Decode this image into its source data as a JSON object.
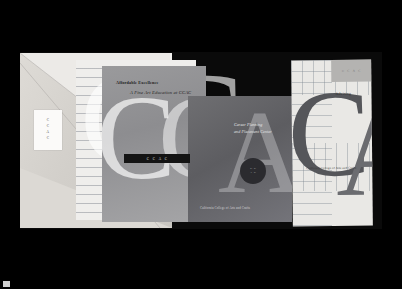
{
  "scene": {
    "title": "CCAC print collateral photograph",
    "background_color": "#000000",
    "plate_color": "#0a0a0a"
  },
  "folder": {
    "name": "presentation-folder",
    "label_card": {
      "logo_letters": [
        "C",
        "C",
        "A",
        "C"
      ]
    }
  },
  "brochure_affordable": {
    "heading": "Affordable Excellence",
    "subheading": "A Fine Art Education at CCAC",
    "logo_bar_letters": [
      "C",
      "C",
      "A",
      "C"
    ],
    "background_color": "#8d8d90"
  },
  "card_career": {
    "line1": "Career Planning",
    "line2": "and Placement Center",
    "seal_letters_top": [
      "C",
      "C"
    ],
    "seal_letters_bottom": [
      "A",
      "C"
    ],
    "footer": "California College of Arts and Crafts",
    "background_color": "#5d5d61"
  },
  "poster": {
    "band_letters": [
      "C",
      "C",
      "A",
      "C"
    ],
    "word": "Advising",
    "footer": "California College of Arts and Crafts",
    "background_color": "#e9e8e5",
    "letterforms": [
      "C",
      "A"
    ]
  },
  "letterforms": {
    "backdrop": [
      "C",
      "C",
      "A",
      "C"
    ]
  }
}
